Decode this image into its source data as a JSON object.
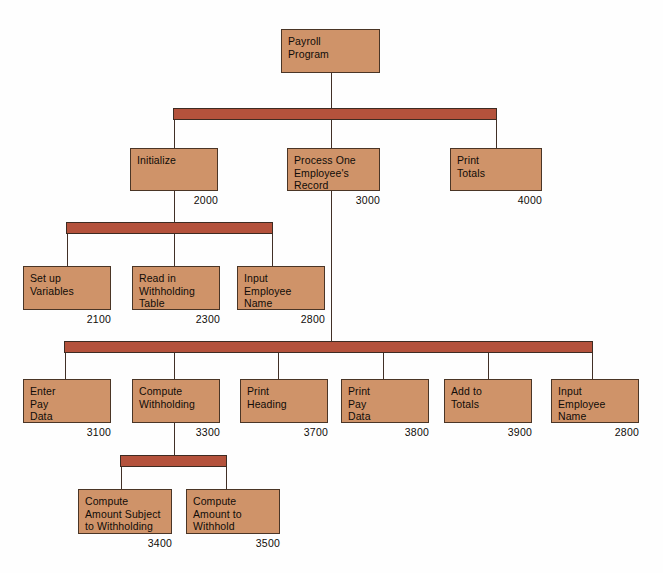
{
  "diagram": {
    "colors": {
      "box_fill": "#cf9369",
      "box_border": "#4a3526",
      "bar_fill": "#b4523c",
      "bar_border": "#3d2b22",
      "line": "#413027",
      "background": "#fefefe",
      "text": "#100c08"
    },
    "levels": [
      {
        "level": 1,
        "modules": [
          {
            "id": "payroll-program",
            "label": "Payroll\nProgram",
            "number": "",
            "x": 281,
            "y": 29,
            "w": 99,
            "h": 44
          }
        ]
      },
      {
        "level": 2,
        "modules": [
          {
            "id": "initialize",
            "label": "Initialize",
            "number": "2000",
            "x": 130,
            "y": 148,
            "w": 88,
            "h": 43
          },
          {
            "id": "process-one-employees-record",
            "label": "Process One\nEmployee's\nRecord",
            "number": "3000",
            "x": 287,
            "y": 148,
            "w": 93,
            "h": 43
          },
          {
            "id": "print-totals",
            "label": "Print\nTotals",
            "number": "4000",
            "x": 450,
            "y": 148,
            "w": 92,
            "h": 43
          }
        ]
      },
      {
        "level": 3,
        "modules": [
          {
            "id": "set-up-variables",
            "label": "Set up\nVariables",
            "number": "2100",
            "x": 23,
            "y": 266,
            "w": 88,
            "h": 44
          },
          {
            "id": "read-in-withholding-table",
            "label": "Read in\nWithholding\nTable",
            "number": "2300",
            "x": 132,
            "y": 266,
            "w": 88,
            "h": 44
          },
          {
            "id": "input-employee-name-2800a",
            "label": "Input\nEmployee\nName",
            "number": "2800",
            "x": 237,
            "y": 266,
            "w": 88,
            "h": 44
          }
        ]
      },
      {
        "level": 4,
        "modules": [
          {
            "id": "enter-pay-data",
            "label": "Enter\nPay\nData",
            "number": "3100",
            "x": 23,
            "y": 379,
            "w": 88,
            "h": 44
          },
          {
            "id": "compute-withholding",
            "label": "Compute\nWithholding",
            "number": "3300",
            "x": 132,
            "y": 379,
            "w": 88,
            "h": 44
          },
          {
            "id": "print-heading",
            "label": "Print\nHeading",
            "number": "3700",
            "x": 240,
            "y": 379,
            "w": 88,
            "h": 44
          },
          {
            "id": "print-pay-data",
            "label": "Print\nPay\nData",
            "number": "3800",
            "x": 341,
            "y": 379,
            "w": 88,
            "h": 44
          },
          {
            "id": "add-to-totals",
            "label": "Add to\nTotals",
            "number": "3900",
            "x": 444,
            "y": 379,
            "w": 88,
            "h": 44
          },
          {
            "id": "input-employee-name-2800b",
            "label": "Input\nEmployee\nName",
            "number": "2800",
            "x": 551,
            "y": 379,
            "w": 88,
            "h": 44
          }
        ]
      },
      {
        "level": 5,
        "modules": [
          {
            "id": "compute-amount-subject-to-withholding",
            "label": "Compute\nAmount Subject\nto Withholding",
            "number": "3400",
            "x": 78,
            "y": 489,
            "w": 94,
            "h": 45
          },
          {
            "id": "compute-amount-to-withhold",
            "label": "Compute\nAmount to\nWithhold",
            "number": "3500",
            "x": 186,
            "y": 489,
            "w": 94,
            "h": 45
          }
        ]
      }
    ],
    "bars": [
      {
        "id": "bar-level-2",
        "x": 173,
        "y": 108,
        "w": 324,
        "h": 12
      },
      {
        "id": "bar-level-3",
        "x": 66,
        "y": 222,
        "w": 207,
        "h": 12
      },
      {
        "id": "bar-level-4",
        "x": 64,
        "y": 341,
        "w": 529,
        "h": 12
      },
      {
        "id": "bar-level-5",
        "x": 120,
        "y": 455,
        "w": 107,
        "h": 12
      }
    ],
    "lines": [
      {
        "id": "line-root-down",
        "x": 331,
        "y": 73,
        "w": 1.4,
        "h": 35
      },
      {
        "id": "line-bar2-to-initialize",
        "x": 174,
        "y": 120,
        "w": 1.4,
        "h": 28
      },
      {
        "id": "line-bar2-to-process",
        "x": 331,
        "y": 120,
        "w": 1.4,
        "h": 28
      },
      {
        "id": "line-bar2-to-print-totals",
        "x": 496,
        "y": 120,
        "w": 1.4,
        "h": 28
      },
      {
        "id": "line-initialize-down",
        "x": 174,
        "y": 191,
        "w": 1.4,
        "h": 31
      },
      {
        "id": "line-bar3-to-setup",
        "x": 67,
        "y": 234,
        "w": 1.4,
        "h": 32
      },
      {
        "id": "line-bar3-to-readin",
        "x": 174,
        "y": 234,
        "w": 1.4,
        "h": 32
      },
      {
        "id": "line-bar3-to-input-name",
        "x": 272,
        "y": 234,
        "w": 1.4,
        "h": 32
      },
      {
        "id": "line-process-down-long",
        "x": 331,
        "y": 191,
        "w": 1.4,
        "h": 150
      },
      {
        "id": "line-bar4-to-enter-pay",
        "x": 65,
        "y": 353,
        "w": 1.4,
        "h": 26
      },
      {
        "id": "line-bar4-to-compute-withholding",
        "x": 174,
        "y": 353,
        "w": 1.4,
        "h": 26
      },
      {
        "id": "line-bar4-to-print-heading",
        "x": 278,
        "y": 353,
        "w": 1.4,
        "h": 26
      },
      {
        "id": "line-bar4-to-print-pay-data",
        "x": 383,
        "y": 353,
        "w": 1.4,
        "h": 26
      },
      {
        "id": "line-bar4-to-add-to-totals",
        "x": 488,
        "y": 353,
        "w": 1.4,
        "h": 26
      },
      {
        "id": "line-bar4-to-input-name-2",
        "x": 592,
        "y": 353,
        "w": 1.4,
        "h": 26
      },
      {
        "id": "line-compute-withholding-down",
        "x": 174,
        "y": 423,
        "w": 1.4,
        "h": 32
      },
      {
        "id": "line-bar5-to-amount-subject",
        "x": 121,
        "y": 467,
        "w": 1.4,
        "h": 22
      },
      {
        "id": "line-bar5-to-amount-withhold",
        "x": 226,
        "y": 467,
        "w": 1.4,
        "h": 22
      }
    ]
  }
}
